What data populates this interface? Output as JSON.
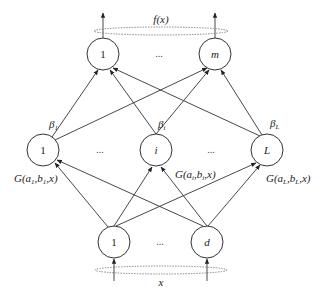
{
  "diagram": {
    "output_label": "f(x)",
    "input_label": "x",
    "output_nodes": [
      {
        "id": "o1",
        "label": "1",
        "italic": false,
        "x": 103,
        "y": 54
      },
      {
        "id": "om",
        "label": "m",
        "italic": true,
        "x": 215,
        "y": 54
      }
    ],
    "output_ellipsis": "...",
    "hidden_nodes": [
      {
        "id": "h1",
        "label": "1",
        "italic": false,
        "x": 43,
        "y": 150,
        "beta": "β",
        "beta_sub": "1",
        "g_label": "G(a",
        "g_sub1": "1",
        "g_mid": ",b",
        "g_sub2": "1",
        "g_end": ",x)"
      },
      {
        "id": "hi",
        "label": "i",
        "italic": true,
        "x": 156,
        "y": 150,
        "beta": "β",
        "beta_sub": "i",
        "g_label": "G(a",
        "g_sub1": "i",
        "g_mid": ",b",
        "g_sub2": "i",
        "g_end": ",x)"
      },
      {
        "id": "hL",
        "label": "L",
        "italic": true,
        "x": 267,
        "y": 150,
        "beta": "β",
        "beta_sub": "L",
        "g_label": "G(a",
        "g_sub1": "L",
        "g_mid": ",b",
        "g_sub2": "L",
        "g_end": ",x)"
      }
    ],
    "hidden_ellipsis": "...",
    "input_nodes": [
      {
        "id": "x1",
        "label": "1",
        "italic": false,
        "x": 114,
        "y": 242
      },
      {
        "id": "xd",
        "label": "d",
        "italic": true,
        "x": 207,
        "y": 242
      }
    ],
    "input_ellipsis": "..."
  }
}
